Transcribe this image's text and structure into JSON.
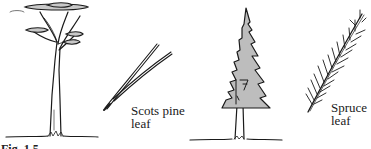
{
  "figure": {
    "panels": [
      {
        "name": "scots-pine",
        "tree": "Scots pine tree (flat-topped crown, tall bare trunk)",
        "leaf_label_line1": "Scots pine",
        "leaf_label_line2": "leaf"
      },
      {
        "name": "spruce",
        "tree": "Spruce tree (conical crown, shaded)",
        "leaf_label_line1": "Spruce",
        "leaf_label_line2": "leaf"
      }
    ],
    "caption_visible_fragment": "Fig. 1.5",
    "colors": {
      "ink": "#1a1a1a",
      "foliage_fill": "#bdbdbd",
      "canopy_fill": "#c8c8c8",
      "background": "#ffffff"
    }
  }
}
